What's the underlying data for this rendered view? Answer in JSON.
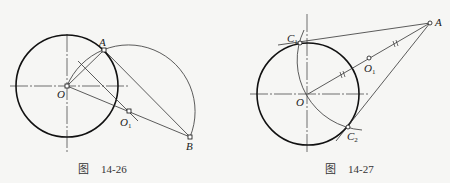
{
  "figures": [
    {
      "caption_prefix": "图",
      "caption_number": "14-26",
      "labels": {
        "A": "A",
        "O": "O",
        "O1_main": "O",
        "O1_sub": "1",
        "B": "B"
      }
    },
    {
      "caption_prefix": "图",
      "caption_number": "14-27",
      "labels": {
        "A": "A",
        "O": "O",
        "O1_main": "O",
        "O1_sub": "1",
        "C1_main": "C",
        "C1_sub": "1",
        "C2_main": "C",
        "C2_sub": "2"
      }
    }
  ],
  "colors": {
    "stroke": "#1a1a1a",
    "background": "#f6f6f4"
  }
}
